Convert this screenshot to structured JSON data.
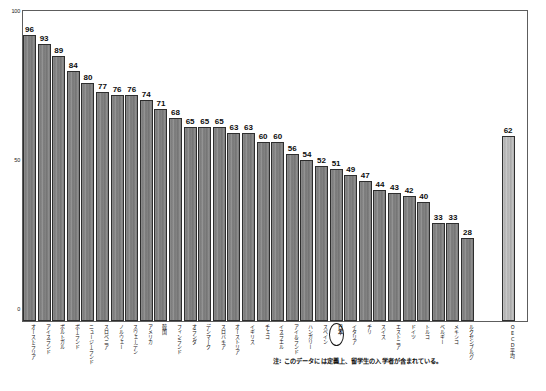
{
  "chart_data": {
    "type": "bar",
    "title": "",
    "xlabel": "",
    "ylabel": "",
    "ylim": [
      0,
      100
    ],
    "yticks": [
      "100",
      "50",
      "0"
    ],
    "ytick_values": [
      100,
      50,
      0
    ],
    "grid": false,
    "legend": "none",
    "highlight_category": "日本",
    "highlight_value": 51,
    "categories": [
      "オーストラリア",
      "アイスランド",
      "ポルトガル",
      "ポーランド",
      "ニュージーランド",
      "スロベニア",
      "ノルウェー",
      "スウェーデン",
      "アメリカ",
      "韓国",
      "フィンランド",
      "オランダ",
      "デンマーク",
      "スロバキア",
      "オーストリア",
      "イギリス",
      "チェコ",
      "イスラエル",
      "アイルランド",
      "ハンガリー",
      "スペイン",
      "日本",
      "イタリア",
      "チリ",
      "スイス",
      "エストニア",
      "ドイツ",
      "トルコ",
      "ベルギー",
      "メキシコ",
      "ルクセンブルグ",
      "OECD平均"
    ],
    "values": [
      96,
      93,
      89,
      84,
      80,
      77,
      76,
      76,
      74,
      71,
      68,
      65,
      65,
      65,
      63,
      63,
      60,
      60,
      56,
      54,
      52,
      51,
      49,
      47,
      44,
      43,
      42,
      40,
      33,
      33,
      28,
      62
    ],
    "value_labels": [
      "96",
      "93",
      "89",
      "84",
      "80",
      "77",
      "76",
      "76",
      "74",
      "71",
      "68",
      "65",
      "65",
      "65",
      "63",
      "63",
      "60",
      "60",
      "56",
      "54",
      "52",
      "51",
      "49",
      "47",
      "44",
      "43",
      "42",
      "40",
      "33",
      "33",
      "28",
      "62"
    ],
    "separated_index": 31,
    "colors": {
      "bar": "#858585",
      "bar_average": "#b8b8b8",
      "bar_border": "#2e2e2e",
      "axis": "#5d5d5d",
      "text": "#111111"
    }
  },
  "footnote": {
    "text": "注: このデータには定義上、留学生の入学者が含まれている。"
  }
}
